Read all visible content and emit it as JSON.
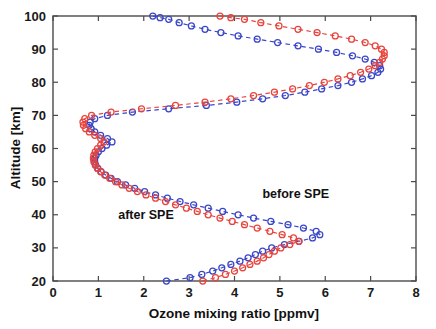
{
  "chart_data": {
    "type": "line",
    "title": "",
    "xlabel": "Ozone mixing ratio [ppmv]",
    "ylabel": "Altitude [km]",
    "xlim": [
      0,
      8
    ],
    "ylim": [
      20,
      100
    ],
    "xticks": [
      0,
      1,
      2,
      3,
      4,
      5,
      6,
      7,
      8
    ],
    "yticks": [
      20,
      30,
      40,
      50,
      60,
      70,
      80,
      90,
      100
    ],
    "xticklabels": [
      "0",
      "1",
      "2",
      "3",
      "4",
      "5",
      "6",
      "7",
      "8"
    ],
    "yticklabels": [
      "20",
      "30",
      "40",
      "50",
      "60",
      "70",
      "80",
      "90",
      "100"
    ],
    "grid": false,
    "legend": "annotations-inline",
    "orientation": "vertical-profile",
    "marker": "open-circle",
    "linestyle": "dashed",
    "annotations": [
      {
        "text": "before SPE",
        "x": 5.35,
        "y": 45.0,
        "color": "#1a1a1a"
      },
      {
        "text": "after SPE",
        "x": 2.05,
        "y": 38.6,
        "color": "#1a1a1a"
      }
    ],
    "series": [
      {
        "name": "before SPE",
        "color": "#3a46c8",
        "x": [
          2.5,
          3.02,
          3.28,
          3.52,
          3.72,
          3.92,
          4.12,
          4.3,
          4.46,
          4.62,
          4.82,
          5.1,
          5.42,
          5.72,
          5.88,
          5.8,
          5.52,
          5.18,
          4.8,
          4.42,
          4.08,
          3.74,
          3.42,
          3.1,
          2.8,
          2.52,
          2.26,
          2.02,
          1.8,
          1.6,
          1.42,
          1.28,
          1.16,
          1.06,
          0.99,
          0.94,
          0.92,
          0.92,
          0.95,
          1.0,
          1.08,
          1.18,
          1.3,
          1.2,
          1.05,
          0.92,
          0.84,
          0.8,
          0.82,
          0.92,
          1.2,
          1.75,
          2.55,
          3.38,
          4.05,
          4.62,
          5.12,
          5.55,
          5.92,
          6.28,
          6.58,
          6.82,
          7.02,
          7.16,
          7.22,
          7.2,
          7.08,
          6.88,
          6.6,
          6.25,
          5.85,
          5.4,
          4.95,
          4.5,
          4.08,
          3.7,
          3.35,
          3.05,
          2.78,
          2.55,
          2.36,
          2.2
        ],
        "y": [
          20.0,
          21.0,
          22.0,
          23.0,
          24.0,
          25.0,
          26.0,
          27.0,
          28.0,
          29.0,
          30.0,
          31.0,
          32.0,
          33.0,
          34.0,
          35.0,
          36.0,
          37.0,
          38.0,
          39.0,
          40.0,
          41.0,
          42.0,
          43.0,
          44.0,
          45.0,
          46.0,
          47.0,
          48.0,
          49.0,
          50.0,
          51.0,
          52.0,
          53.0,
          54.0,
          55.0,
          56.0,
          57.0,
          58.0,
          59.0,
          60.0,
          61.0,
          62.0,
          63.0,
          64.0,
          65.0,
          66.0,
          67.0,
          68.0,
          69.0,
          70.0,
          71.0,
          72.0,
          73.0,
          74.0,
          75.0,
          76.0,
          77.0,
          78.0,
          79.0,
          80.0,
          81.0,
          82.0,
          83.0,
          84.0,
          85.0,
          86.0,
          87.0,
          88.0,
          89.0,
          90.0,
          91.0,
          92.0,
          93.0,
          94.0,
          95.0,
          96.0,
          97.0,
          98.0,
          99.0,
          99.5,
          100.0
        ]
      },
      {
        "name": "after SPE",
        "color": "#e8433c",
        "x": [
          3.3,
          3.58,
          3.8,
          4.0,
          4.18,
          4.34,
          4.5,
          4.64,
          4.76,
          4.88,
          5.02,
          5.22,
          5.42,
          5.3,
          5.05,
          4.78,
          4.5,
          4.22,
          3.95,
          3.68,
          3.42,
          3.18,
          2.94,
          2.7,
          2.48,
          2.26,
          2.05,
          1.86,
          1.68,
          1.52,
          1.38,
          1.25,
          1.14,
          1.05,
          0.98,
          0.93,
          0.9,
          0.89,
          0.9,
          0.93,
          0.98,
          1.05,
          1.12,
          1.05,
          0.92,
          0.8,
          0.72,
          0.67,
          0.66,
          0.7,
          0.85,
          1.28,
          1.95,
          2.7,
          3.35,
          3.92,
          4.42,
          4.88,
          5.28,
          5.65,
          5.98,
          6.28,
          6.55,
          6.78,
          6.96,
          7.1,
          7.2,
          7.26,
          7.3,
          7.3,
          7.24,
          7.1,
          6.88,
          6.58,
          6.22,
          5.82,
          5.4,
          4.98,
          4.58,
          4.22,
          3.92,
          3.68
        ],
        "y": [
          20.0,
          21.0,
          22.0,
          23.0,
          24.0,
          25.0,
          26.0,
          27.0,
          28.0,
          29.0,
          30.0,
          31.0,
          32.0,
          33.0,
          34.0,
          35.0,
          36.0,
          37.0,
          38.0,
          39.0,
          40.0,
          41.0,
          42.0,
          43.0,
          44.0,
          45.0,
          46.0,
          47.0,
          48.0,
          49.0,
          50.0,
          51.0,
          52.0,
          53.0,
          54.0,
          55.0,
          56.0,
          57.0,
          58.0,
          59.0,
          60.0,
          61.0,
          62.0,
          63.0,
          64.0,
          65.0,
          66.0,
          67.0,
          68.0,
          69.0,
          70.0,
          71.0,
          72.0,
          73.0,
          74.0,
          75.0,
          76.0,
          77.0,
          78.0,
          79.0,
          80.0,
          81.0,
          82.0,
          83.0,
          84.0,
          85.0,
          86.0,
          87.0,
          88.0,
          89.0,
          90.0,
          91.0,
          92.0,
          93.0,
          94.0,
          95.0,
          96.0,
          97.0,
          98.0,
          99.0,
          99.5,
          100.0
        ]
      }
    ]
  }
}
